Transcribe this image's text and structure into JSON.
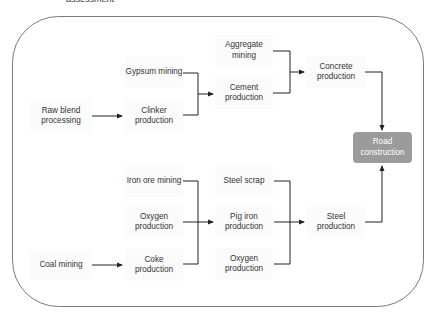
{
  "caption": "assessment",
  "diagram": {
    "type": "flowchart",
    "frame": {
      "shape": "rounded-rectangle",
      "stroke": "#7a7a7a"
    },
    "colors": {
      "node_text": "#333333",
      "node_bg": "#fbfbfb",
      "target_bg": "#9b9b9b",
      "target_text": "#ffffff",
      "line": "#222222"
    },
    "nodes": {
      "raw_blend": "Raw blend processing",
      "gypsum": "Gypsum mining",
      "clinker": "Clinker production",
      "aggregate": "Aggregate mining",
      "cement": "Cement production",
      "concrete": "Concrete production",
      "road": "Road construction",
      "iron_ore": "Iron ore mining",
      "oxygen1": "Oxygen production",
      "coal": "Coal mining",
      "coke": "Coke production",
      "steel_scrap": "Steel scrap",
      "pig_iron": "Pig iron production",
      "oxygen2": "Oxygen production",
      "steel": "Steel production"
    },
    "edges": [
      [
        "Raw blend processing",
        "Clinker production"
      ],
      [
        "Gypsum mining",
        "Cement production"
      ],
      [
        "Clinker production",
        "Cement production"
      ],
      [
        "Aggregate mining",
        "Concrete production"
      ],
      [
        "Cement production",
        "Concrete production"
      ],
      [
        "Concrete production",
        "Road construction"
      ],
      [
        "Coal mining",
        "Coke production"
      ],
      [
        "Iron ore mining",
        "Pig iron production"
      ],
      [
        "Oxygen production",
        "Pig iron production"
      ],
      [
        "Coke production",
        "Pig iron production"
      ],
      [
        "Steel scrap",
        "Steel production"
      ],
      [
        "Pig iron production",
        "Steel production"
      ],
      [
        "Oxygen production",
        "Steel production"
      ],
      [
        "Steel production",
        "Road construction"
      ]
    ]
  }
}
